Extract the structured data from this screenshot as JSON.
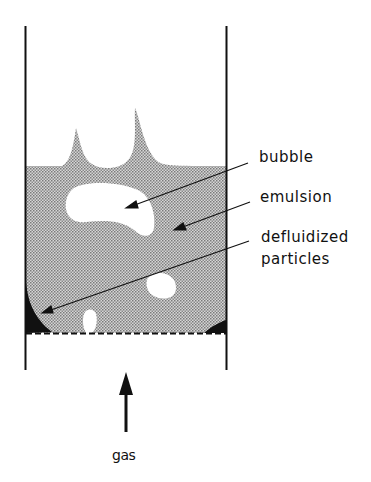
{
  "figure": {
    "type": "fluidized-bed-schematic",
    "labels": {
      "bubble": "bubble",
      "emulsion": "emulsion",
      "defluidized_line1": "defluidized",
      "defluidized_line2": "particles",
      "gas": "gas"
    },
    "colors": {
      "wall": "#111111",
      "emulsion_fill": "#b8b8b8",
      "defluidized_fill": "#111111",
      "bubble_fill": "#ffffff",
      "background": "#ffffff"
    }
  }
}
